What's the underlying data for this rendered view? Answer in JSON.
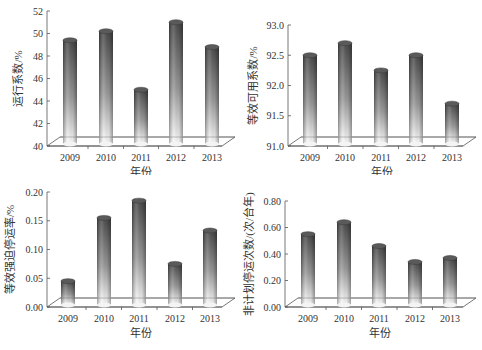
{
  "chart_data": [
    {
      "type": "bar",
      "title": "",
      "xlabel": "年份",
      "ylabel": "运行系数/%",
      "categories": [
        "2009",
        "2010",
        "2011",
        "2012",
        "2013"
      ],
      "values": [
        49.4,
        50.2,
        45.0,
        51.0,
        48.8
      ],
      "ylim": [
        40,
        52
      ],
      "yticks": [
        "40",
        "42",
        "44",
        "46",
        "48",
        "50",
        "52"
      ],
      "grid": false,
      "legend": null,
      "style": "3d-cylinder"
    },
    {
      "type": "bar",
      "title": "",
      "xlabel": "年份",
      "ylabel": "等效可用系数/%",
      "categories": [
        "2009",
        "2010",
        "2011",
        "2012",
        "2013"
      ],
      "values": [
        92.5,
        92.7,
        92.25,
        92.5,
        91.7
      ],
      "ylim": [
        91.0,
        93.0
      ],
      "yticks": [
        "91.0",
        "91.5",
        "92.0",
        "92.5",
        "93.0"
      ],
      "grid": false,
      "legend": null,
      "style": "3d-cylinder"
    },
    {
      "type": "bar",
      "title": "",
      "xlabel": "年份",
      "ylabel": "等效强迫停运率/%",
      "categories": [
        "2009",
        "2010",
        "2011",
        "2012",
        "2013"
      ],
      "values": [
        0.045,
        0.155,
        0.185,
        0.075,
        0.133
      ],
      "ylim": [
        0.0,
        0.2
      ],
      "yticks": [
        "0.00",
        "0.05",
        "0.10",
        "0.15",
        "0.20"
      ],
      "grid": false,
      "legend": null,
      "style": "3d-cylinder"
    },
    {
      "type": "bar",
      "title": "",
      "xlabel": "年份",
      "ylabel": "非计划停运次数/(次/台年)",
      "categories": [
        "2009",
        "2010",
        "2011",
        "2012",
        "2013"
      ],
      "values": [
        0.55,
        0.64,
        0.46,
        0.34,
        0.37
      ],
      "ylim": [
        0.0,
        0.8
      ],
      "yticks": [
        "0.00",
        "0.20",
        "0.40",
        "0.60",
        "0.80"
      ],
      "grid": false,
      "legend": null,
      "style": "3d-cylinder"
    }
  ],
  "colors": {
    "bar_dark": "#4a4a4a",
    "bar_light": "#ffffff",
    "axis": "#555555",
    "text": "#333333"
  }
}
